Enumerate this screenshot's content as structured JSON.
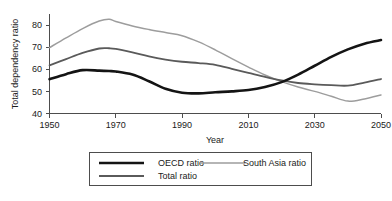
{
  "chart_data": {
    "type": "line",
    "title": "",
    "xlabel": "Year",
    "ylabel": "Total dependency ratio",
    "xlim": [
      1950,
      2050
    ],
    "ylim": [
      40,
      85
    ],
    "grid": false,
    "legend_position": "bottom",
    "xticks": [
      "1950",
      "1970",
      "1990",
      "2010",
      "2030",
      "2050"
    ],
    "xtick_values": [
      1950,
      1970,
      1990,
      2010,
      2030,
      2050
    ],
    "yticks": [
      "40",
      "50",
      "60",
      "70",
      "80"
    ],
    "ytick_values": [
      40,
      50,
      60,
      70,
      80
    ],
    "x": [
      1950,
      1955,
      1960,
      1965,
      1968,
      1970,
      1975,
      1980,
      1985,
      1990,
      1995,
      2000,
      2005,
      2010,
      2015,
      2020,
      2025,
      2030,
      2035,
      2040,
      2045,
      2050
    ],
    "series": [
      {
        "name": "OECD ratio",
        "color": "#141414",
        "width": 2.6,
        "values": [
          55.5,
          57.8,
          59.6,
          59.4,
          59.2,
          59.0,
          57.6,
          54.6,
          51.2,
          49.4,
          49.1,
          49.6,
          50.0,
          50.6,
          52.0,
          54.2,
          57.6,
          61.6,
          65.6,
          69.0,
          71.6,
          73.2
        ]
      },
      {
        "name": "South Asia ratio",
        "color": "#9d9d9d",
        "width": 1.5,
        "values": [
          69.8,
          74.2,
          78.4,
          81.8,
          82.6,
          81.6,
          79.6,
          78.0,
          76.6,
          75.2,
          72.4,
          68.8,
          64.8,
          61.0,
          57.4,
          54.4,
          52.0,
          50.0,
          47.8,
          45.6,
          46.6,
          48.4
        ]
      },
      {
        "name": "Total ratio",
        "color": "#5a5a5a",
        "width": 1.8,
        "values": [
          61.8,
          64.6,
          67.4,
          69.4,
          69.5,
          69.2,
          67.6,
          65.8,
          64.4,
          63.4,
          62.8,
          62.0,
          60.2,
          58.4,
          56.6,
          55.0,
          53.8,
          53.2,
          52.8,
          52.6,
          54.0,
          55.6
        ]
      }
    ]
  },
  "legend": {
    "entries": [
      {
        "label": "OECD ratio"
      },
      {
        "label": "South Asia ratio"
      },
      {
        "label": "Total ratio"
      }
    ]
  }
}
